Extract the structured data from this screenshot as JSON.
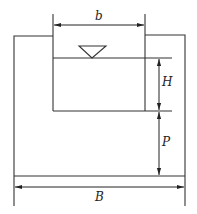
{
  "diagram": {
    "type": "weir-channel-cross-section",
    "labels": {
      "top_width": "b",
      "head": "H",
      "weir_height": "P",
      "channel_width": "B"
    },
    "symbols": {
      "water_surface": "inverted-triangle"
    },
    "colors": {
      "stroke": "#333333",
      "background": "#ffffff"
    }
  }
}
